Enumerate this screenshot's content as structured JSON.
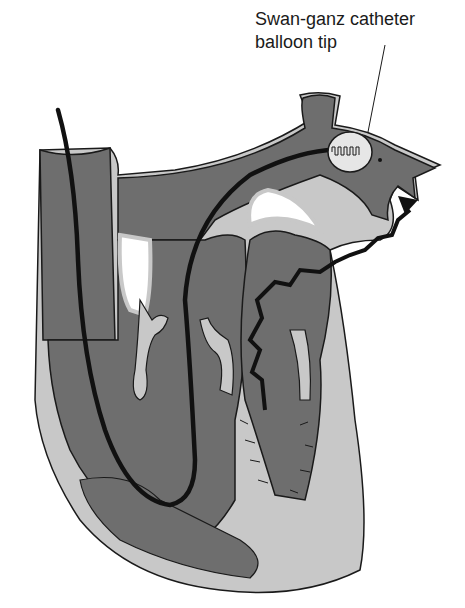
{
  "figure": {
    "annotations": [
      {
        "id": "balloon-tip",
        "line1": "Swan-ganz catheter",
        "line2": "balloon tip"
      }
    ]
  },
  "colors": {
    "chamber": "#6e6e6e",
    "wall": "#c8c8c8",
    "outline": "#1a1a1a",
    "catheter": "#111111",
    "balloon": "#e6e6e6",
    "background": "#ffffff"
  },
  "structures": [
    "superior-vena-cava",
    "pulmonary-artery",
    "pulmonary-artery-branch",
    "right-atrium",
    "right-ventricle",
    "left-ventricle",
    "septum",
    "catheter",
    "balloon",
    "pressure-waveform-arrow"
  ]
}
